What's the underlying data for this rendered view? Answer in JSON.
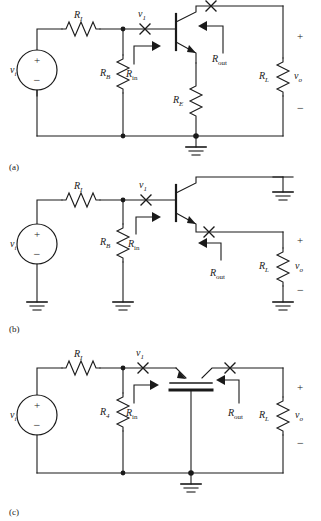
{
  "figure": {
    "type": "circuit-schematic-set",
    "panel_count": 3,
    "line_color": "#1a1a1a",
    "background": "#ffffff"
  },
  "labels": {
    "R_I": "R",
    "R_I_sub": "I",
    "R_B": "R",
    "R_B_sub": "B",
    "R_E": "R",
    "R_E_sub": "E",
    "R_L": "R",
    "R_L_sub": "L",
    "R_G": "R",
    "R_G_sub": "4",
    "R_in": "R",
    "R_in_sub": "in",
    "R_out": "R",
    "R_out_sub": "out",
    "v_i": "v",
    "v_i_sub": "i",
    "v_1": "v",
    "v_1_sub": "1",
    "v_o": "v",
    "v_o_sub": "o",
    "plus": "+",
    "minus": "−"
  },
  "panels": [
    {
      "id": "a",
      "caption": "(a)",
      "device": "npn-bjt",
      "topology": "common-collector-with-emitter-resistor",
      "components": [
        "v_i",
        "R_I",
        "R_B",
        "R_E",
        "R_L"
      ],
      "ground_count": 1,
      "measure_points": [
        "v_1",
        "R_in",
        "R_out"
      ]
    },
    {
      "id": "b",
      "caption": "(b)",
      "device": "npn-bjt",
      "topology": "emitter-follower-grounded-collector",
      "components": [
        "v_i",
        "R_I",
        "R_B",
        "R_L"
      ],
      "ground_count": 4,
      "measure_points": [
        "v_1",
        "R_in",
        "R_out"
      ]
    },
    {
      "id": "c",
      "caption": "(c)",
      "device": "fet",
      "topology": "source-follower",
      "components": [
        "v_i",
        "R_I",
        "R_4",
        "R_L"
      ],
      "ground_count": 1,
      "measure_points": [
        "v_1",
        "R_in",
        "R_out"
      ]
    }
  ]
}
